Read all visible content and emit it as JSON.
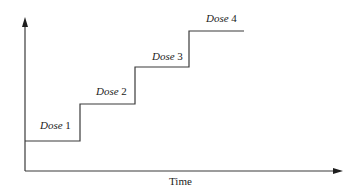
{
  "diagram": {
    "type": "step-function",
    "x_axis_label": "Time",
    "y_axis_label": "",
    "steps": [
      {
        "label_word": "Dose",
        "label_num": "1",
        "label": "Dose 1"
      },
      {
        "label_word": "Dose",
        "label_num": "2",
        "label": "Dose 2"
      },
      {
        "label_word": "Dose",
        "label_num": "3",
        "label": "Dose 3"
      },
      {
        "label_word": "Dose",
        "label_num": "4",
        "label": "Dose 4"
      }
    ],
    "colors": {
      "line": "#3a3a3a",
      "arrow": "#1e1e1e",
      "text": "#222222",
      "background": "#ffffff"
    }
  }
}
